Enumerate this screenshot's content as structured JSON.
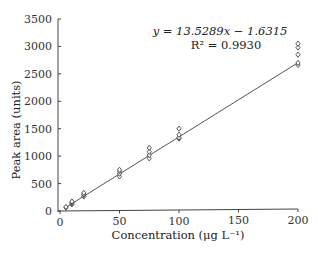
{
  "chart_data": {
    "type": "scatter",
    "title": "",
    "xlabel": "Concentration (μg L⁻¹)",
    "ylabel": "Peak area (units)",
    "xlim": [
      0,
      200
    ],
    "ylim": [
      0,
      3500
    ],
    "xticks": [
      0,
      50,
      100,
      150,
      200
    ],
    "yticks": [
      0,
      500,
      1000,
      1500,
      2000,
      2500,
      3000,
      3500
    ],
    "grid": false,
    "legend": null,
    "marker": "open diamond",
    "series": [
      {
        "name": "replicates",
        "points": [
          {
            "x": 5,
            "y": 60
          },
          {
            "x": 5,
            "y": 75
          },
          {
            "x": 10,
            "y": 120
          },
          {
            "x": 10,
            "y": 140
          },
          {
            "x": 10,
            "y": 155
          },
          {
            "x": 10,
            "y": 175
          },
          {
            "x": 20,
            "y": 265
          },
          {
            "x": 20,
            "y": 290
          },
          {
            "x": 20,
            "y": 305
          },
          {
            "x": 20,
            "y": 330
          },
          {
            "x": 50,
            "y": 630
          },
          {
            "x": 50,
            "y": 680
          },
          {
            "x": 50,
            "y": 720
          },
          {
            "x": 50,
            "y": 750
          },
          {
            "x": 75,
            "y": 960
          },
          {
            "x": 75,
            "y": 1020
          },
          {
            "x": 75,
            "y": 1080
          },
          {
            "x": 75,
            "y": 1150
          },
          {
            "x": 100,
            "y": 1320
          },
          {
            "x": 100,
            "y": 1340
          },
          {
            "x": 100,
            "y": 1390
          },
          {
            "x": 100,
            "y": 1500
          },
          {
            "x": 200,
            "y": 2660
          },
          {
            "x": 200,
            "y": 2700
          },
          {
            "x": 200,
            "y": 2850
          },
          {
            "x": 200,
            "y": 2980
          },
          {
            "x": 200,
            "y": 3050
          }
        ]
      }
    ],
    "fit": {
      "type": "linear",
      "slope": 13.5289,
      "intercept": -1.6315,
      "r2": 0.993,
      "x_range": [
        5,
        200
      ]
    },
    "annotations": {
      "equation": "y = 13.5289x − 1.6315",
      "r_squared": "R² = 0.9930"
    }
  }
}
